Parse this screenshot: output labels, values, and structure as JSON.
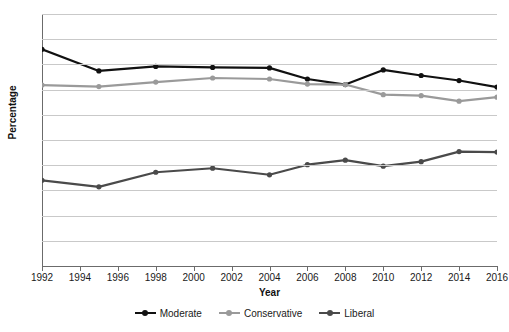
{
  "chart_data": {
    "type": "line",
    "title": "",
    "xlabel": "Year",
    "ylabel": "Percentage",
    "x": [
      1992,
      1995,
      1998,
      2001,
      2004,
      2006,
      2008,
      2010,
      2012,
      2014,
      2016
    ],
    "xtick_labels": [
      "1992",
      "1994",
      "1996",
      "1998",
      "2000",
      "2002",
      "2004",
      "2006",
      "2008",
      "2010",
      "2012",
      "2014",
      "2016"
    ],
    "xtick_values": [
      1992,
      1994,
      1996,
      1998,
      2000,
      2002,
      2004,
      2006,
      2008,
      2010,
      2012,
      2014,
      2016
    ],
    "ytick_labels": [
      "0",
      "5",
      "10",
      "15",
      "20",
      "25",
      "30",
      "35",
      "40",
      "45",
      "50"
    ],
    "ytick_values": [
      0,
      5,
      10,
      15,
      20,
      25,
      30,
      35,
      40,
      45,
      50
    ],
    "xlim": [
      1992,
      2016
    ],
    "ylim": [
      0,
      50
    ],
    "grid": true,
    "legend_position": "bottom",
    "series": [
      {
        "name": "Moderate",
        "color": "#111111",
        "values": [
          43.0,
          38.7,
          39.6,
          39.4,
          39.3,
          37.1,
          36.0,
          38.9,
          37.8,
          36.8,
          35.5
        ]
      },
      {
        "name": "Conservative",
        "color": "#9a9a9a",
        "values": [
          35.9,
          35.6,
          36.5,
          37.3,
          37.1,
          36.1,
          36.0,
          34.0,
          33.8,
          32.7,
          33.5
        ]
      },
      {
        "name": "Liberal",
        "color": "#4a4a4a",
        "values": [
          17.0,
          15.7,
          18.6,
          19.4,
          18.1,
          20.1,
          21.0,
          19.8,
          20.7,
          22.7,
          22.6
        ]
      }
    ]
  }
}
